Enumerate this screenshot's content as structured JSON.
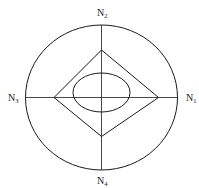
{
  "diagram": {
    "type": "node-region diagram",
    "stroke_color": "#1a1a1a",
    "background": "#ffffff",
    "labels": {
      "n1": {
        "main": "N",
        "sub": "1"
      },
      "n2": {
        "main": "N",
        "sub": "2"
      },
      "n3": {
        "main": "N",
        "sub": "3"
      },
      "n4": {
        "main": "N",
        "sub": "4"
      }
    },
    "shapes": {
      "outer_circle": {
        "cx": 101.5,
        "cy": 97.5,
        "rx": 76,
        "ry": 72.5
      },
      "diamond": {
        "top": [
          101.5,
          50
        ],
        "right": [
          158.5,
          97.5
        ],
        "bottom": [
          101.5,
          136.5
        ],
        "left": [
          54,
          97.5
        ]
      },
      "inner_ellipse": {
        "cx": 101.5,
        "cy": 92.5,
        "rx": 28.5,
        "ry": 19.5
      },
      "axes": {
        "horizontal": {
          "x1": 25.5,
          "x2": 177.5,
          "y": 97.5
        },
        "vertical": {
          "x": 101.5,
          "y1": 25,
          "y2": 170
        }
      }
    }
  }
}
